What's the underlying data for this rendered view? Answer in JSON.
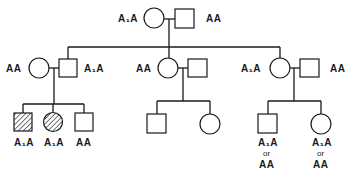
{
  "diagram": {
    "type": "pedigree",
    "colors": {
      "line": "#1a1a1a",
      "fill": "#ffffff",
      "hatch": "#1a1a1a"
    },
    "generation1": {
      "mother": {
        "sex": "female",
        "genotype": "A₁A",
        "affected": false
      },
      "father": {
        "sex": "male",
        "genotype": "AA",
        "affected": false
      }
    },
    "generation2": {
      "family_left": {
        "mother": {
          "sex": "female",
          "genotype": "AA",
          "affected": false
        },
        "father": {
          "sex": "male",
          "genotype": "A₁A",
          "affected": false
        },
        "children": [
          {
            "sex": "male",
            "genotype": "A₁A",
            "affected": true
          },
          {
            "sex": "female",
            "genotype": "A₁A",
            "affected": true
          },
          {
            "sex": "male",
            "genotype": "AA",
            "affected": false
          }
        ]
      },
      "family_middle": {
        "mother": {
          "sex": "female",
          "genotype": "AA",
          "affected": false
        },
        "father": {
          "sex": "male",
          "genotype": "",
          "affected": false
        },
        "children": [
          {
            "sex": "male",
            "genotype": "",
            "affected": false
          },
          {
            "sex": "female",
            "genotype": "",
            "affected": false
          }
        ]
      },
      "family_right": {
        "mother": {
          "sex": "female",
          "genotype": "A₁A",
          "affected": false
        },
        "father": {
          "sex": "male",
          "genotype": "AA",
          "affected": false
        },
        "children": [
          {
            "sex": "male",
            "genotype_line1": "A₁A",
            "or_text": "or",
            "genotype_line2": "AA",
            "affected": false
          },
          {
            "sex": "female",
            "genotype_line1": "A₁A",
            "or_text": "or",
            "genotype_line2": "AA",
            "affected": false
          }
        ]
      }
    }
  }
}
